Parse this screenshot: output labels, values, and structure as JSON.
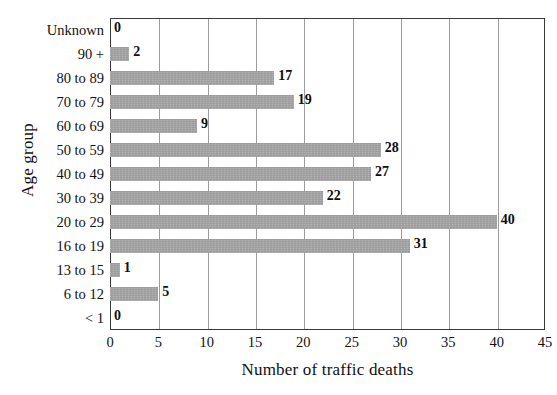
{
  "chart_data": {
    "type": "bar",
    "orientation": "horizontal",
    "title": "",
    "xlabel": "Number of traffic deaths",
    "ylabel": "Age group",
    "xlim": [
      0,
      45
    ],
    "xticks": [
      0,
      5,
      10,
      15,
      20,
      25,
      30,
      35,
      40,
      45
    ],
    "grid": "vertical",
    "legend": "none",
    "bar_color": "#9a9a9a",
    "axis_color": "#3a3a3a",
    "categories": [
      "Unknown",
      "90 +",
      "80 to 89",
      "70 to 79",
      "60 to 69",
      "50 to 59",
      "40 to 49",
      "30 to 39",
      "20 to 29",
      "16 to 19",
      "13 to 15",
      "6 to 12",
      "< 1"
    ],
    "values": [
      0,
      2,
      17,
      19,
      9,
      28,
      27,
      22,
      40,
      31,
      1,
      5,
      0
    ],
    "data_labels": [
      "0",
      "2",
      "17",
      "19",
      "9",
      "28",
      "27",
      "22",
      "40",
      "31",
      "1",
      "5",
      "0"
    ],
    "tick_labels": [
      "0",
      "5",
      "10",
      "15",
      "20",
      "25",
      "30",
      "35",
      "40",
      "45"
    ]
  }
}
